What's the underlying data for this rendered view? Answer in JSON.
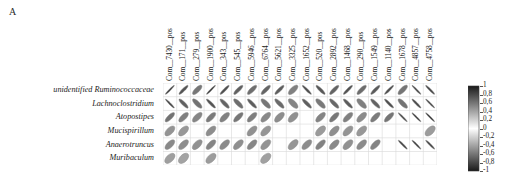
{
  "panel": {
    "label": "A"
  },
  "figure": {
    "type": "correlation-ellipse-matrix",
    "grid_left": 163,
    "grid_top": 83,
    "cell": 13.7,
    "rows": 6,
    "cols": 20
  },
  "chart_data": {
    "type": "heatmap",
    "title": "",
    "xlabel": "",
    "ylabel": "",
    "grid": true,
    "legend_position": "right",
    "colorbar": {
      "ticks": [
        "1",
        "0,8",
        "0,6",
        "0,4",
        "0,2",
        "0",
        "-0,2",
        "-0,4",
        "-0,6",
        "-0,8",
        "-1"
      ],
      "values": [
        1,
        0.8,
        0.6,
        0.4,
        0.2,
        0,
        -0.2,
        -0.4,
        -0.6,
        -0.8,
        -1
      ],
      "vmin": -1,
      "vmax": 1,
      "high_color": "#1a1a1a",
      "mid_color": "#ffffff",
      "low_color": "#1a1a1a"
    },
    "categories": [
      "Com__7430__pos",
      "Com__171__pos",
      "Com__279__pos",
      "Com__1900__pos",
      "Com__343__pos",
      "Com__545__pos",
      "Com__5946__pos",
      "Com__6764__pos",
      "Com__5621__pos",
      "Com__3325__pos",
      "Com__1652__pos",
      "Com__520__pos",
      "Com__2892__pos",
      "Com__1468__pos",
      "Com__290__pos",
      "Com__1549__pos",
      "Com__1140__pos",
      "Com__1678__pos",
      "Com__4857__pos",
      "Com__4758__pos"
    ],
    "rows": [
      "unidentified Ruminococcaceae",
      "Lachnoclostridium",
      "Atopostipes",
      "Mucispirillum",
      "Anaerotruncus",
      "Muribaculum"
    ],
    "series": [
      {
        "name": "unidentified Ruminococcaceae",
        "values": [
          0.92,
          0.78,
          0.62,
          0.93,
          0.8,
          0.72,
          0.66,
          0.7,
          0.74,
          0.58,
          -0.82,
          -0.76,
          0.71,
          0.79,
          0.67,
          0.75,
          0.82,
          0.63,
          -0.88,
          -0.84
        ]
      },
      {
        "name": "Lachnoclostridium",
        "values": [
          -0.86,
          -0.72,
          -0.64,
          -0.78,
          -0.7,
          -0.66,
          -0.74,
          -0.62,
          -0.68,
          -0.56,
          -0.73,
          -0.61,
          -0.69,
          -0.75,
          -0.58,
          -0.71,
          -0.8,
          -0.64,
          -0.83,
          -0.9
        ]
      },
      {
        "name": "Atopostipes",
        "values": [
          0.64,
          0.58,
          0.55,
          0.6,
          0.57,
          0.62,
          0.59,
          0.54,
          0.52,
          0.5,
          null,
          0.56,
          0.61,
          0.58,
          0.53,
          0.6,
          0.63,
          -0.87,
          -0.91,
          -0.93
        ]
      },
      {
        "name": "Mucispirillum",
        "values": [
          0.49,
          0.47,
          null,
          0.52,
          null,
          null,
          0.5,
          0.48,
          null,
          null,
          null,
          0.46,
          0.51,
          0.49,
          0.47,
          null,
          null,
          null,
          null,
          0.45
        ]
      },
      {
        "name": "Anaerotruncus",
        "values": [
          0.54,
          0.52,
          0.5,
          0.56,
          0.53,
          0.51,
          0.55,
          0.49,
          null,
          0.48,
          0.52,
          0.57,
          0.54,
          0.5,
          0.53,
          0.56,
          null,
          -0.85,
          -0.89,
          -0.86
        ]
      },
      {
        "name": "Muribaculum",
        "values": [
          0.44,
          0.42,
          null,
          0.45,
          null,
          null,
          null,
          0.43,
          null,
          null,
          null,
          null,
          null,
          null,
          null,
          null,
          null,
          null,
          null,
          null
        ]
      }
    ]
  }
}
